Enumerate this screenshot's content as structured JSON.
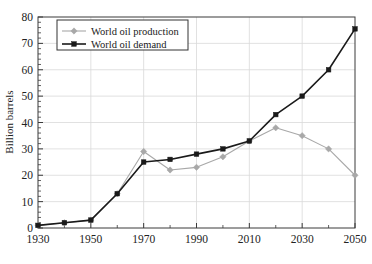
{
  "chart_data": {
    "type": "line",
    "title": "",
    "subtitle": "",
    "xlabel": "",
    "ylabel": "Billion barrels",
    "x": [
      1930,
      1940,
      1950,
      1960,
      1970,
      1980,
      1990,
      2000,
      2010,
      2020,
      2030,
      2040,
      2050
    ],
    "xlim": [
      1930,
      2050
    ],
    "ylim": [
      0,
      80
    ],
    "xticks": [
      1930,
      1950,
      1970,
      1990,
      2010,
      2030,
      2050
    ],
    "xtick_labels": [
      "1930",
      "1950",
      "1970",
      "1990",
      "2010",
      "2030",
      "2050"
    ],
    "xminor_step": 10,
    "yticks": [
      0,
      10,
      20,
      30,
      40,
      50,
      60,
      70,
      80
    ],
    "ytick_labels": [
      "0",
      "10",
      "20",
      "30",
      "40",
      "50",
      "60",
      "70",
      "80"
    ],
    "yminor_step": 2,
    "grid": true,
    "grid_color": "#d9d9d9",
    "legend_position": "upper-left",
    "series": [
      {
        "name": "World oil production",
        "color": "#a8a8a8",
        "marker": "diamond",
        "values": [
          1,
          2,
          3,
          13,
          29,
          22,
          23,
          27,
          33,
          38,
          35,
          30,
          20
        ]
      },
      {
        "name": "World oil demand",
        "color": "#1a1a1a",
        "marker": "square",
        "values": [
          1,
          2,
          3,
          13,
          25,
          26,
          28,
          30,
          33,
          43,
          50,
          60,
          75.5
        ]
      }
    ]
  },
  "legend": {
    "items": [
      {
        "label": "World oil production"
      },
      {
        "label": "World oil demand"
      }
    ]
  },
  "axes": {
    "y_title": "Billion barrels"
  }
}
